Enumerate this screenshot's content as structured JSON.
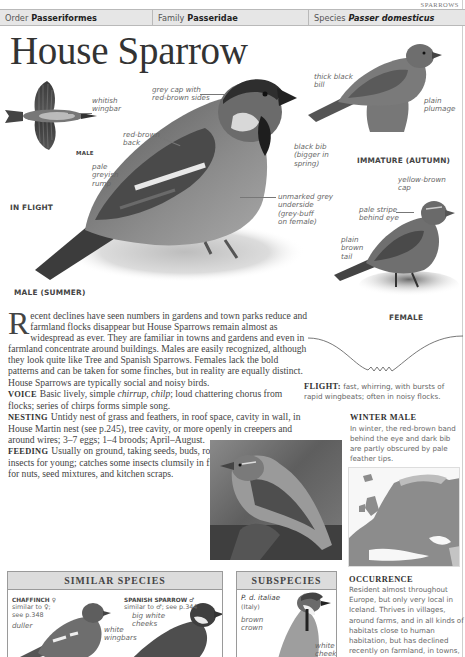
{
  "section_tag": "SPARROWS",
  "taxonomy": {
    "order_label": "Order",
    "order_value": "Passeriformes",
    "family_label": "Family",
    "family_value": "Passeridae",
    "species_label": "Species",
    "species_value": "Passer domesticus"
  },
  "title": "House Sparrow",
  "illustrations": {
    "in_flight": {
      "caption": "IN FLIGHT",
      "sex_tag": "MALE",
      "labels": [
        "whitish\nwingbar"
      ]
    },
    "male_summer": {
      "caption": "MALE (SUMMER)",
      "labels": {
        "cap": "grey cap with\nred-brown sides",
        "back": "red-brown\nback",
        "rump": "pale\ngreyish\nrump",
        "bill": "thick black\nbill",
        "bib": "black bib\n(bigger in\nspring)",
        "underside": "unmarked grey\nunderside\n(grey-buff\non female)"
      }
    },
    "immature": {
      "caption": "IMMATURE (AUTUMN)",
      "labels": {
        "plumage": "plain\nplumage"
      }
    },
    "female": {
      "caption": "FEMALE",
      "labels": {
        "cap": "yellow-brown\ncap",
        "stripe": "pale stripe\nbehind eye",
        "tail": "plain\nbrown\ntail"
      }
    }
  },
  "body": {
    "dropcap": "R",
    "intro": "ecent declines have seen numbers in gardens and town parks reduce and farmland flocks disappear but House Sparrows remain almost as widespread as ever. They are familiar in towns and gardens and even in farmland concentrate around buildings. Males are easily recognized, although they look quite like Tree and Spanish Sparrows. Females lack the bold patterns and can be taken for some finches, but in reality are equally distinct. House Sparrows are typically social and noisy birds.",
    "voice_label": "VOICE",
    "voice_pre": "Basic lively, simple ",
    "voice_calls": "chirrup, chilp",
    "voice_post": "; loud chattering chorus from flocks; series of chirps forms simple song.",
    "nesting_label": "NESTING",
    "nesting_text": "Untidy nest of grass and feathers, in roof space, cavity in wall, in House Martin nest (see p.245), tree cavity, or more openly in creepers and around wires; 3–7 eggs; 1–4 broods; April–August.",
    "feeding_label": "FEEDING",
    "feeding_text": "Usually on ground, taking seeds, buds, roots, berries, and many insects for young; catches some insects clumsily in flight; visits bird-tables for nuts, seed mixtures, and kitchen scraps."
  },
  "flight": {
    "label": "FLIGHT:",
    "text": " fast, whirring, with bursts of rapid wingbeats; often in noisy flocks."
  },
  "winter_male": {
    "title": "WINTER MALE",
    "text": "In winter, the red-brown band behind the eye and dark bib are partly obscured by pale feather tips."
  },
  "occurrence": {
    "title": "OCCURRENCE",
    "text": "Resident almost throughout Europe, but only very local in Iceland. Thrives in villages, around farms, and in all kinds of habitats close to human habitation, but has declined recently on farmland, in towns, and in suburban gardens."
  },
  "similar_species": {
    "heading": "SIMILAR SPECIES",
    "items": [
      {
        "name": "CHAFFINCH ♀",
        "note": "similar to ♀;\nsee p.348",
        "labels": [
          "duller",
          "white\nwingbars"
        ]
      },
      {
        "name": "SPANISH SPARROW ♂",
        "note": "similar to ♂; see p.344",
        "labels": [
          "big white\ncheeks"
        ]
      }
    ]
  },
  "subspecies": {
    "heading": "SUBSPECIES",
    "name": "P. d. italiae",
    "region": "(Italy)",
    "labels": [
      "brown\ncrown",
      "white\ncheeks"
    ]
  },
  "colors": {
    "header_bar": "#e6e6e6",
    "box_header": "#dcdcdc",
    "text": "#444444",
    "label": "#666666",
    "map_range": "#8c8c8c"
  }
}
